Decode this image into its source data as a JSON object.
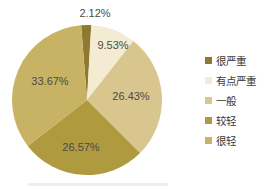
{
  "chart_data": {
    "type": "pie",
    "title": "",
    "categories": [
      "很严重",
      "有点严重",
      "一般",
      "较轻",
      "很轻"
    ],
    "values": [
      2.12,
      9.53,
      26.43,
      26.57,
      33.67
    ],
    "slice_labels": [
      "2.12%",
      "9.53%",
      "26.43%",
      "26.57%",
      "33.67%"
    ],
    "colors": [
      "#8e7931",
      "#f3ecd2",
      "#d9c68e",
      "#b09a3f",
      "#c8b263"
    ],
    "label_color": "#4a4a4a",
    "legend_position": "right",
    "start_angle_deg": -4.5
  }
}
